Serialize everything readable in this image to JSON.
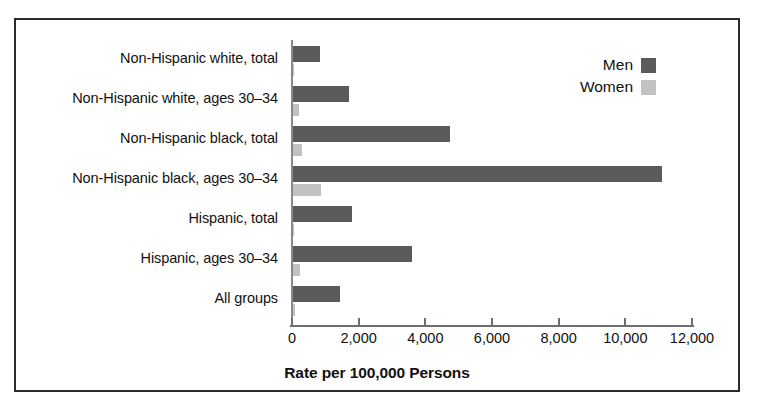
{
  "chart_data": {
    "type": "bar",
    "orientation": "horizontal",
    "title": "",
    "xlabel": "Rate per 100,000 Persons",
    "ylabel": "",
    "xlim": [
      0,
      12800
    ],
    "grid": false,
    "legend_position": "top-right",
    "categories": [
      "Non-Hispanic white, total",
      "Non-Hispanic white, ages 30–34",
      "Non-Hispanic black, total",
      "Non-Hispanic black, ages 30–34",
      "Hispanic, total",
      "Hispanic, ages 30–34",
      "All groups"
    ],
    "series": [
      {
        "name": "Men",
        "color": "#5b5b5b",
        "values": [
          840,
          1700,
          4740,
          11100,
          1800,
          3600,
          1450
        ]
      },
      {
        "name": "Women",
        "color": "#c2c2c2",
        "values": [
          60,
          200,
          300,
          880,
          70,
          250,
          100
        ]
      }
    ],
    "xticks": [
      0,
      2000,
      4000,
      6000,
      8000,
      10000,
      12000
    ],
    "xtick_labels": [
      "0",
      "2,000",
      "4,000",
      "6,000",
      "8,000",
      "10,000",
      "12,000"
    ]
  },
  "legend": {
    "entries": [
      {
        "label": "Men"
      },
      {
        "label": "Women"
      }
    ]
  },
  "axis": {
    "title": "Rate per 100,000 Persons"
  }
}
